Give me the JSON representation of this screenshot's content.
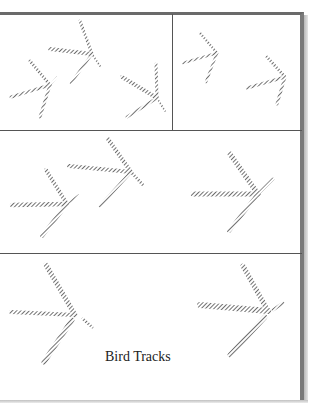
{
  "page": {
    "header_fragment": "",
    "caption": "Bird Tracks"
  },
  "panels": [
    {
      "id": "row1-left",
      "description": "three bird tracks"
    },
    {
      "id": "row1-right",
      "description": "two small bird tracks"
    },
    {
      "id": "row2",
      "description": "three bird tracks"
    },
    {
      "id": "row3",
      "description": "two bird tracks with caption"
    }
  ],
  "colors": {
    "frame": "#6a6a6a",
    "track_ink": "#555555",
    "caption_text": "#222222"
  }
}
